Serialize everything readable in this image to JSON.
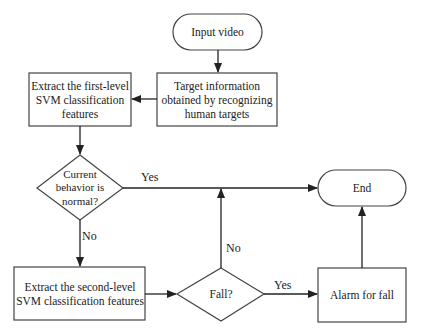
{
  "diagram": {
    "type": "flowchart",
    "colors": {
      "line": "#333333",
      "fill": "#ffffff",
      "text": "#222222"
    },
    "nodes": {
      "input_video": {
        "shape": "terminal",
        "text": "Input video"
      },
      "target_info": {
        "shape": "process",
        "text": "Target information obtained by recognizing human targets"
      },
      "extract_first": {
        "shape": "process",
        "text": "Extract the first-level SVM classification features"
      },
      "normal_decision": {
        "shape": "decision",
        "text": "Current behavior is normal?"
      },
      "end": {
        "shape": "terminal",
        "text": "End"
      },
      "extract_second": {
        "shape": "process",
        "text": "Extract the second-level SVM classification features"
      },
      "fall_decision": {
        "shape": "decision",
        "text": "Fall?"
      },
      "alarm": {
        "shape": "process",
        "text": "Alarm for fall"
      }
    },
    "edges": [
      {
        "from": "input_video",
        "to": "target_info",
        "label": ""
      },
      {
        "from": "target_info",
        "to": "extract_first",
        "label": ""
      },
      {
        "from": "extract_first",
        "to": "normal_decision",
        "label": ""
      },
      {
        "from": "normal_decision",
        "to": "end",
        "label": "Yes"
      },
      {
        "from": "normal_decision",
        "to": "extract_second",
        "label": "No"
      },
      {
        "from": "extract_second",
        "to": "fall_decision",
        "label": ""
      },
      {
        "from": "fall_decision",
        "to": "end",
        "label": "No"
      },
      {
        "from": "fall_decision",
        "to": "alarm",
        "label": "Yes"
      },
      {
        "from": "alarm",
        "to": "end",
        "label": ""
      }
    ],
    "edge_labels": {
      "normal_yes": "Yes",
      "normal_no": "No",
      "fall_no": "No",
      "fall_yes": "Yes"
    }
  }
}
